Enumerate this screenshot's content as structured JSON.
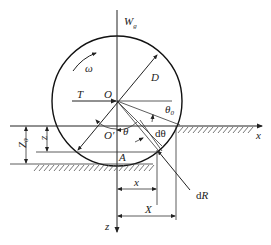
{
  "diagram": {
    "title": "",
    "labels": {
      "weight": {
        "main": "W",
        "sub": "g"
      },
      "omega": "ω",
      "diameter": "D",
      "tow_force": "T",
      "center": "O",
      "lowered_center": "O′",
      "theta0": {
        "main": "θ",
        "sub": "0"
      },
      "theta": "θ",
      "dtheta": "dθ",
      "x_axis": "x",
      "z_axis": "z",
      "sinkage_total": {
        "main": "Z",
        "sub": "0"
      },
      "sinkage_z": "z",
      "point_a": "A",
      "x_dim": "x",
      "X_dim": "X",
      "dR": {
        "prefix": "d",
        "main": "R"
      }
    },
    "colors": {
      "line": "#222222",
      "background": "#ffffff"
    }
  }
}
